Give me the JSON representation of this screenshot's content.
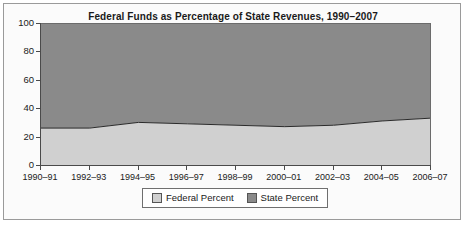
{
  "chart_data": {
    "type": "area",
    "title": "Federal Funds as Percentage of State Revenues, 1990–2007",
    "xlabel": "",
    "ylabel": "",
    "ylim": [
      0,
      100
    ],
    "yticks": [
      "0",
      "20",
      "40",
      "60",
      "80",
      "100"
    ],
    "grid": false,
    "stacked": true,
    "legend_position": "bottom",
    "categories": [
      "1990–91",
      "1992–93",
      "1994–95",
      "1996–97",
      "1998–99",
      "2000–01",
      "2002–03",
      "2004–05",
      "2006–07"
    ],
    "series": [
      {
        "name": "Federal Percent",
        "color": "#d0d0d0",
        "values": [
          26,
          26,
          30,
          29,
          28,
          27,
          28,
          31,
          33
        ]
      },
      {
        "name": "State Percent",
        "color": "#8a8a8a",
        "values": [
          74,
          74,
          70,
          71,
          72,
          73,
          72,
          69,
          67
        ]
      }
    ]
  },
  "legend": {
    "items": [
      {
        "label": "Federal Percent",
        "color": "#d0d0d0"
      },
      {
        "label": "State Percent",
        "color": "#8a8a8a"
      }
    ]
  }
}
